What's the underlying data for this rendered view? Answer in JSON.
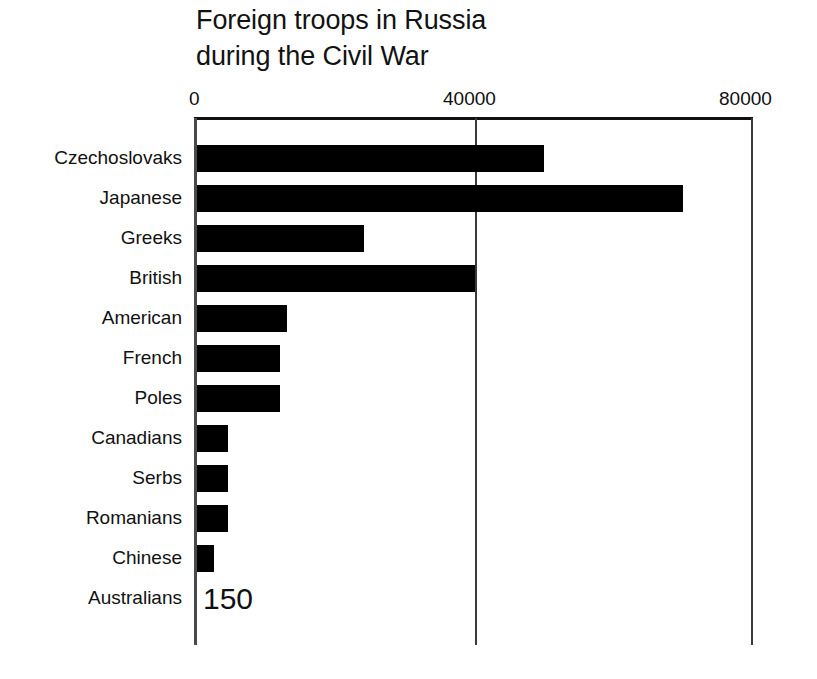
{
  "chart_data": {
    "type": "bar",
    "orientation": "horizontal",
    "title": "Foreign troops in Russia\nduring the Civil War",
    "xlabel": "",
    "ylabel": "",
    "xlim": [
      0,
      80000
    ],
    "xticks": [
      "0",
      "40000",
      "80000"
    ],
    "xtick_values": [
      0,
      40000,
      80000
    ],
    "tick_position": "top",
    "grid": true,
    "legend": false,
    "bar_color": "#000000",
    "categories": [
      "Czechoslovaks",
      "Japanese",
      "Greeks",
      "British",
      "American",
      "French",
      "Poles",
      "Canadians",
      "Serbs",
      "Romanians",
      "Chinese",
      "Australians"
    ],
    "values": [
      50000,
      70000,
      24000,
      40000,
      13000,
      12000,
      12000,
      4500,
      4500,
      4500,
      2500,
      150
    ],
    "annotations": [
      {
        "category": "Australians",
        "text": "150"
      }
    ]
  }
}
